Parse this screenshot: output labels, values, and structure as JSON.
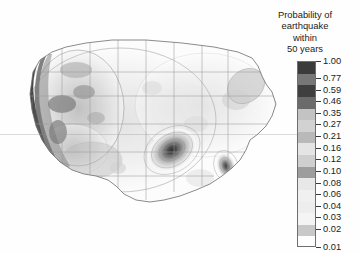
{
  "legend": {
    "title_lines": [
      "Probability of",
      "earthquake",
      "within",
      "50 years"
    ],
    "ticks": [
      {
        "value": "1.00",
        "shade": "#3b3b3b"
      },
      {
        "value": "0.77",
        "shade": "#777777"
      },
      {
        "value": "0.59",
        "shade": "#3f3f3f"
      },
      {
        "value": "0.46",
        "shade": "#6b6b6b"
      },
      {
        "value": "0.35",
        "shade": "#c3c3c3"
      },
      {
        "value": "0.27",
        "shade": "#d2d2d2"
      },
      {
        "value": "0.21",
        "shade": "#b9b9b9"
      },
      {
        "value": "0.16",
        "shade": "#e4e4e4"
      },
      {
        "value": "0.12",
        "shade": "#cfcfcf"
      },
      {
        "value": "0.10",
        "shade": "#9d9d9d"
      },
      {
        "value": "0.08",
        "shade": "#e8e8e8"
      },
      {
        "value": "0.06",
        "shade": "#f0f0f0"
      },
      {
        "value": "0.04",
        "shade": "#ededed"
      },
      {
        "value": "0.03",
        "shade": "#f4f4f4"
      },
      {
        "value": "0.02",
        "shade": "#c8c8c8"
      },
      {
        "value": "0.01",
        "shade": "#fdfdfd"
      }
    ]
  },
  "chart_data": {
    "type": "heatmap",
    "title": "Probability of earthquake within 50 years",
    "subtitle": "",
    "xlabel": "",
    "ylabel": "",
    "colormap": "grayscale-discrete",
    "legend_position": "right",
    "grid": false,
    "region": "Contiguous United States",
    "levels": [
      0.01,
      0.02,
      0.03,
      0.04,
      0.06,
      0.08,
      0.1,
      0.12,
      0.16,
      0.21,
      0.27,
      0.35,
      0.46,
      0.59,
      0.77,
      1.0
    ],
    "level_labels": [
      "0.01",
      "0.02",
      "0.03",
      "0.04",
      "0.06",
      "0.08",
      "0.10",
      "0.12",
      "0.16",
      "0.21",
      "0.27",
      "0.35",
      "0.46",
      "0.59",
      "0.77",
      "1.00"
    ],
    "zlim": [
      0.01,
      1.0
    ],
    "hotspots": [
      {
        "name": "Pacific Northwest / Cascadia coast",
        "value": 1.0
      },
      {
        "name": "Northern California coast",
        "value": 1.0
      },
      {
        "name": "San Andreas / Southern California",
        "value": 1.0
      },
      {
        "name": "Nevada / Basin and Range",
        "value": 0.46
      },
      {
        "name": "Intermountain West / Wasatch",
        "value": 0.35
      },
      {
        "name": "New Madrid seismic zone",
        "value": 0.77
      },
      {
        "name": "Charleston, South Carolina",
        "value": 0.59
      },
      {
        "name": "Northeast corridor / New England",
        "value": 0.16
      },
      {
        "name": "Great Plains interior",
        "value": 0.02
      }
    ]
  }
}
